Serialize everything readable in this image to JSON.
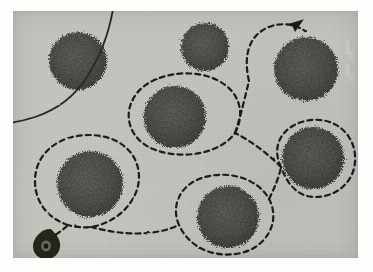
{
  "image": {
    "kind": "scanned-aerial-photograph",
    "frame": {
      "x": 13,
      "y": 11,
      "width": 345,
      "height": 247
    },
    "canvas": {
      "width": 373,
      "height": 272
    },
    "background_color": "#c9c7c2",
    "margin_color": "#fdfdfc",
    "ink_color": "#1d1c1a",
    "canopy_color": "#5a5a58",
    "canopy_dark": "#3d3e3c",
    "canopy_light": "#8a8a85"
  },
  "legend": {
    "tree_label": "tree-canopy",
    "route_label": "dashed-survey-route",
    "road_label": "solid-boundary-line",
    "marker_label": "start-point-marker",
    "arrow_label": "route-direction-arrow"
  },
  "trees": [
    {
      "id": "tree-top-left",
      "cx": 65,
      "cy": 50,
      "r": 29,
      "encircled": false
    },
    {
      "id": "tree-top-center",
      "cx": 192,
      "cy": 36,
      "r": 24,
      "encircled": false
    },
    {
      "id": "tree-top-right",
      "cx": 293,
      "cy": 58,
      "r": 32,
      "encircled": true
    },
    {
      "id": "tree-center",
      "cx": 162,
      "cy": 106,
      "r": 31,
      "encircled": true
    },
    {
      "id": "tree-mid-right",
      "cx": 300,
      "cy": 147,
      "r": 31,
      "encircled": true
    },
    {
      "id": "tree-bottom-left",
      "cx": 77,
      "cy": 173,
      "r": 33,
      "encircled": true
    },
    {
      "id": "tree-bottom-center",
      "cx": 215,
      "cy": 206,
      "r": 31,
      "encircled": true
    }
  ],
  "route": {
    "style": "dashed",
    "dash_pattern": "5 4",
    "stroke_width": 2.2,
    "color": "#1d1c1a",
    "direction": "counter-clockwise-ending-top-right",
    "loops_count": 5,
    "arrow": {
      "x": 264,
      "y": 22,
      "angle": -38
    },
    "start_marker": {
      "x": 44,
      "y": 240
    }
  },
  "road": {
    "style": "solid",
    "stroke_width": 1.8,
    "color": "#2a2926",
    "description": "curved-line-top-left"
  },
  "edge_marks": {
    "description": "faint-light-scan-artifacts-right-edge"
  }
}
